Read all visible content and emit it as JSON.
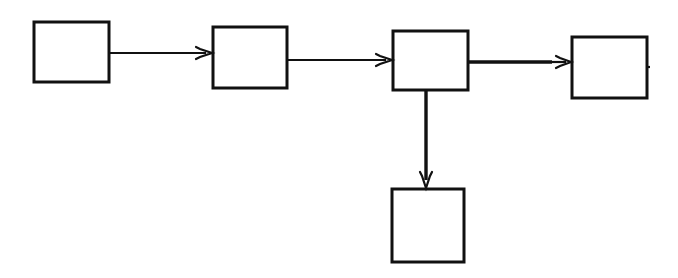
{
  "diagram": {
    "type": "block-flow",
    "stroke_color": "#111111",
    "background": "#ffffff",
    "nodes": [
      {
        "id": "n1",
        "label": "",
        "x": 34,
        "y": 22,
        "w": 75,
        "h": 60
      },
      {
        "id": "n2",
        "label": "",
        "x": 213,
        "y": 27,
        "w": 74,
        "h": 61
      },
      {
        "id": "n3",
        "label": "",
        "x": 393,
        "y": 31,
        "w": 75,
        "h": 59
      },
      {
        "id": "n4",
        "label": "",
        "x": 572,
        "y": 37,
        "w": 75,
        "h": 61
      },
      {
        "id": "n5",
        "label": "",
        "x": 392,
        "y": 189,
        "w": 72,
        "h": 73
      }
    ],
    "edges": [
      {
        "from": "n1",
        "to": "n2",
        "direction": "right"
      },
      {
        "from": "n2",
        "to": "n3",
        "direction": "right"
      },
      {
        "from": "n3",
        "to": "n4",
        "direction": "right",
        "weight": "thick"
      },
      {
        "from": "n3",
        "to": "n5",
        "direction": "down"
      }
    ]
  }
}
